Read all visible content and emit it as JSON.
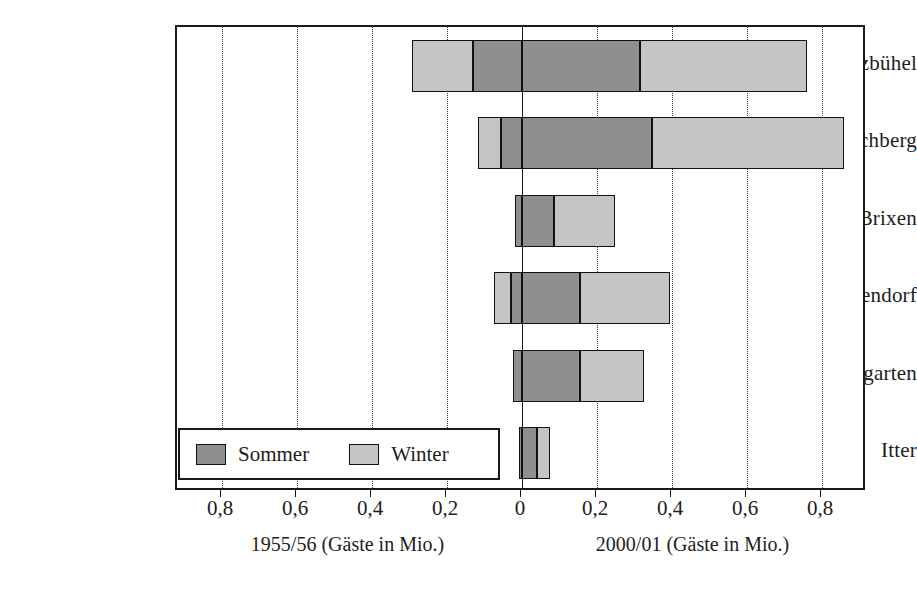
{
  "chart_data": {
    "type": "bar",
    "orientation": "horizontal",
    "subtype": "diverging-stacked",
    "title": "",
    "subtitle": "",
    "categories": [
      "Kitzbühel",
      "Kirchberg",
      "Brixen",
      "Westendorf",
      "Hopfgarten",
      "Itter"
    ],
    "left_axis_caption": "1955/56 (Gäste in Mio.)",
    "right_axis_caption": "2000/01 (Gäste in Mio.)",
    "xlabel": "",
    "ylabel": "",
    "unit": "Mio.",
    "tick_labels": [
      "0,8",
      "0,6",
      "0,4",
      "0,2",
      "0",
      "0,2",
      "0,4",
      "0,6",
      "0,8"
    ],
    "tick_values": [
      -0.8,
      -0.6,
      -0.4,
      -0.2,
      0,
      0.2,
      0.4,
      0.6,
      0.8
    ],
    "xlim": [
      -0.92,
      0.92
    ],
    "grid": true,
    "grid_style": "dotted",
    "legend": {
      "position": "bottom-left-inside",
      "entries": [
        {
          "label": "Sommer",
          "color": "#8f8f8f"
        },
        {
          "label": "Winter",
          "color": "#c5c5c5"
        }
      ]
    },
    "series": [
      {
        "name": "1955/56 Winter",
        "side": "left",
        "season": "Winter",
        "color": "#c5c5c5",
        "values": [
          0.163,
          0.063,
          0.0,
          0.045,
          0.0,
          0.0
        ]
      },
      {
        "name": "1955/56 Sommer",
        "side": "left",
        "season": "Sommer",
        "color": "#8f8f8f",
        "values": [
          0.131,
          0.055,
          0.019,
          0.029,
          0.024,
          0.008
        ]
      },
      {
        "name": "2000/01 Sommer",
        "side": "right",
        "season": "Sommer",
        "color": "#8f8f8f",
        "values": [
          0.315,
          0.347,
          0.085,
          0.155,
          0.155,
          0.04
        ]
      },
      {
        "name": "2000/01 Winter",
        "side": "right",
        "season": "Winter",
        "color": "#c5c5c5",
        "values": [
          0.445,
          0.512,
          0.163,
          0.24,
          0.171,
          0.035
        ]
      }
    ],
    "bars": [
      {
        "category": "Kitzbühel",
        "left_winter": 0.163,
        "left_sommer": 0.131,
        "right_sommer": 0.315,
        "right_winter": 0.445
      },
      {
        "category": "Kirchberg",
        "left_winter": 0.063,
        "left_sommer": 0.055,
        "right_sommer": 0.347,
        "right_winter": 0.512
      },
      {
        "category": "Brixen",
        "left_winter": 0.0,
        "left_sommer": 0.019,
        "right_sommer": 0.085,
        "right_winter": 0.163
      },
      {
        "category": "Westendorf",
        "left_winter": 0.045,
        "left_sommer": 0.029,
        "right_sommer": 0.155,
        "right_winter": 0.24
      },
      {
        "category": "Hopfgarten",
        "left_winter": 0.0,
        "left_sommer": 0.024,
        "right_sommer": 0.155,
        "right_winter": 0.171
      },
      {
        "category": "Itter",
        "left_winter": 0.0,
        "left_sommer": 0.008,
        "right_sommer": 0.04,
        "right_winter": 0.035
      }
    ]
  },
  "axis": {
    "ticks": [
      {
        "label": "0,8",
        "value": -0.8
      },
      {
        "label": "0,6",
        "value": -0.6
      },
      {
        "label": "0,4",
        "value": -0.4
      },
      {
        "label": "0,2",
        "value": -0.2
      },
      {
        "label": "0",
        "value": 0
      },
      {
        "label": "0,2",
        "value": 0.2
      },
      {
        "label": "0,4",
        "value": 0.4
      },
      {
        "label": "0,6",
        "value": 0.6
      },
      {
        "label": "0,8",
        "value": 0.8
      }
    ],
    "left_caption": "1955/56 (Gäste in Mio.)",
    "right_caption": "2000/01 (Gäste in Mio.)"
  },
  "categories": [
    "Kitzbühel",
    "Kirchberg",
    "Brixen",
    "Westendorf",
    "Hopfgarten",
    "Itter"
  ],
  "legend": {
    "sommer_label": "Sommer",
    "winter_label": "Winter",
    "sommer_color": "#8f8f8f",
    "winter_color": "#c5c5c5"
  }
}
